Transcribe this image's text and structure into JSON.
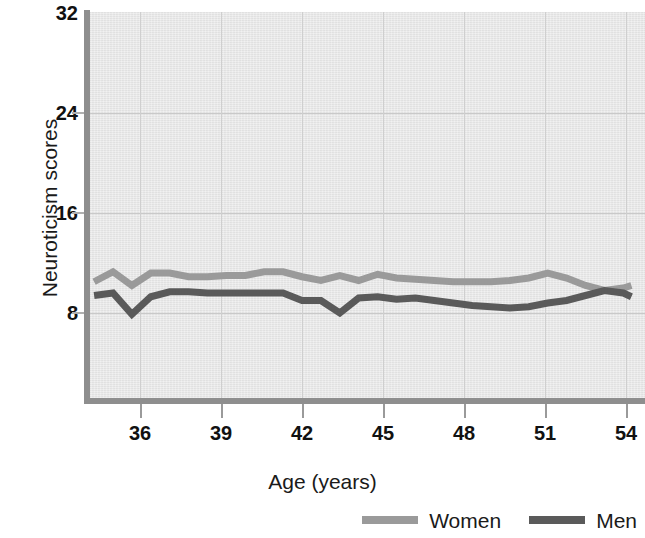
{
  "chart_data": {
    "type": "line",
    "title": "",
    "subtitle": "",
    "xlabel": "Age (years)",
    "ylabel": "Neuroticism scores",
    "xlim": [
      34.3,
      54.3
    ],
    "ylim": [
      0,
      32
    ],
    "xticks": [
      36,
      39,
      42,
      45,
      48,
      51,
      54
    ],
    "yticks": [
      8,
      16,
      24,
      32
    ],
    "grid": true,
    "legend_position": "bottom-right",
    "x": [
      34.3,
      35.0,
      35.7,
      36.4,
      37.1,
      37.8,
      38.5,
      39.2,
      39.9,
      40.6,
      41.3,
      42.0,
      42.7,
      43.4,
      44.1,
      44.8,
      45.5,
      46.2,
      46.9,
      47.6,
      48.3,
      49.0,
      49.7,
      50.4,
      51.1,
      51.8,
      52.5,
      53.2,
      53.9,
      54.2
    ],
    "series": [
      {
        "name": "Women",
        "color": "#9a9a9a",
        "values": [
          10.5,
          11.3,
          10.2,
          11.2,
          11.2,
          10.9,
          10.9,
          11.0,
          11.0,
          11.3,
          11.3,
          10.9,
          10.6,
          11.0,
          10.6,
          11.1,
          10.8,
          10.7,
          10.6,
          10.5,
          10.5,
          10.5,
          10.6,
          10.8,
          11.2,
          10.8,
          10.2,
          9.8,
          10.0,
          10.2
        ]
      },
      {
        "name": "Men",
        "color": "#5a5a5a",
        "values": [
          9.4,
          9.6,
          7.9,
          9.3,
          9.7,
          9.7,
          9.6,
          9.6,
          9.6,
          9.6,
          9.6,
          9.0,
          9.0,
          8.0,
          9.2,
          9.3,
          9.1,
          9.2,
          9.0,
          8.8,
          8.6,
          8.5,
          8.4,
          8.5,
          8.8,
          9.0,
          9.4,
          9.8,
          9.6,
          9.3
        ]
      }
    ]
  },
  "axes": {
    "y_title": "Neuroticism scores",
    "x_title": "Age (years)",
    "y_tick_labels": [
      "32",
      "24",
      "16",
      "8"
    ],
    "x_tick_labels": [
      "36",
      "39",
      "42",
      "45",
      "48",
      "51",
      "54"
    ]
  },
  "legend": {
    "items": [
      {
        "label": "Women",
        "color": "#9a9a9a"
      },
      {
        "label": "Men",
        "color": "#5a5a5a"
      }
    ]
  },
  "colors": {
    "plot_background": "#e6e6e6",
    "axis": "#8e8e8e",
    "gridline": "#c9c9c9",
    "text": "#111111",
    "women": "#9a9a9a",
    "men": "#5a5a5a"
  }
}
